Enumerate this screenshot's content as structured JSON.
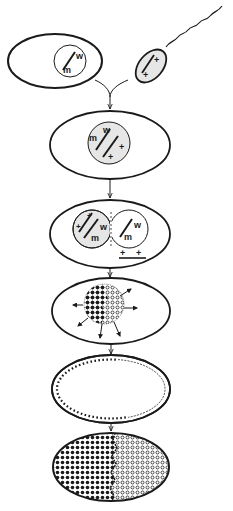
{
  "diagram": {
    "colors": {
      "ink": "#1a1a1a",
      "shade": "#e6e6e6",
      "background": "#ffffff"
    },
    "stages": [
      {
        "id": "egg",
        "label": "egg with nucleus",
        "nucleus_alleles": {
          "upper": "w",
          "lower": "m"
        }
      },
      {
        "id": "sperm",
        "label": "sperm",
        "alleles": [
          "+",
          "+"
        ]
      },
      {
        "id": "zygote",
        "label": "zygote",
        "nucleus_alleles": {
          "upper": "w",
          "lower": "m",
          "plus_a": "+",
          "plus_b": "+"
        }
      },
      {
        "id": "two-cell",
        "label": "two nuclei",
        "left_alleles": {
          "plus_a": "+",
          "plus_b": "+",
          "upper": "w",
          "lower": "m"
        },
        "right_alleles": {
          "upper": "w",
          "lower": "m"
        },
        "excluded_alleles": [
          "+",
          "+"
        ]
      },
      {
        "id": "cleavage",
        "label": "proliferating nuclei"
      },
      {
        "id": "blastoderm",
        "label": "syncytial blastoderm"
      },
      {
        "id": "mosaic",
        "label": "mosaic embryo"
      }
    ]
  }
}
